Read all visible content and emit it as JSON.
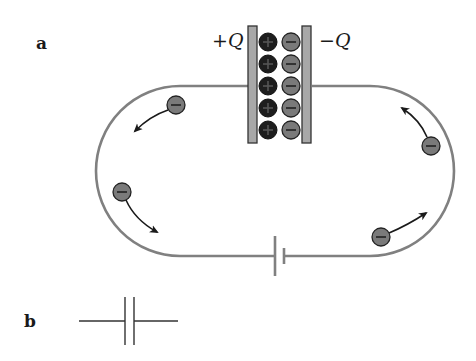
{
  "panels": {
    "a": {
      "label": "a"
    },
    "b": {
      "label": "b"
    }
  },
  "capacitor": {
    "left_plate_label": "+Q",
    "right_plate_label": "−Q",
    "positive_charge_count": 5,
    "negative_charge_count": 5,
    "positive_symbol": "+",
    "negative_symbol": "−"
  },
  "electrons": [
    {
      "id": "electron-top-left",
      "symbol": "−",
      "direction": "down-left"
    },
    {
      "id": "electron-bottom-left",
      "symbol": "−",
      "direction": "down-right"
    },
    {
      "id": "electron-top-right",
      "symbol": "−",
      "direction": "up-left"
    },
    {
      "id": "electron-bottom-right",
      "symbol": "−",
      "direction": "up-right"
    }
  ],
  "components": {
    "battery": "battery-symbol",
    "capacitor_symbol": "capacitor-symbol"
  },
  "colors": {
    "wire": "#808080",
    "plate_fill": "#a8a8a8",
    "plate_stroke": "#333333",
    "positive_charge": "#1e1e1e",
    "negative_charge": "#7a7a7a",
    "arrow": "#1a1a1a",
    "text": "#1a1a1a"
  }
}
